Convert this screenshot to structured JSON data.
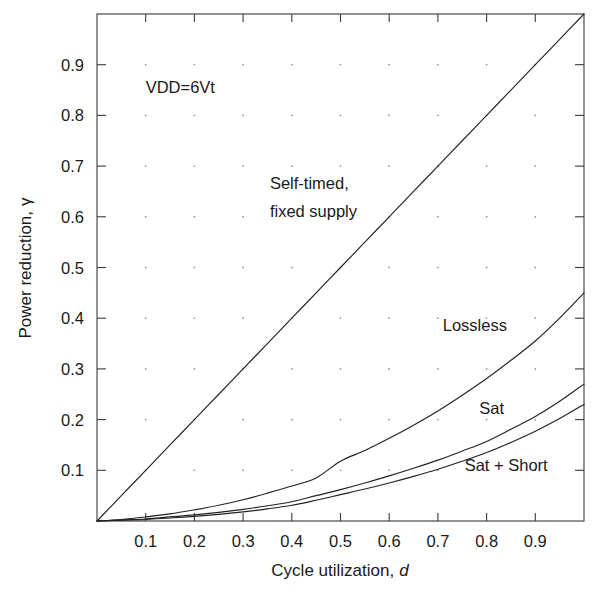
{
  "chart_data": {
    "type": "line",
    "title": "",
    "xlabel": "Cycle utilization, d",
    "xlabel_main": "Cycle utilization,",
    "xlabel_italic": "d",
    "ylabel": "Power reduction, γ",
    "ylabel_main": "Power reduction,",
    "ylabel_symbol": "γ",
    "xlim": [
      0,
      1
    ],
    "ylim": [
      0,
      1
    ],
    "grid": "dots at 0.1 intervals",
    "legend_position": "inline annotations on curves",
    "xticks": [
      0.1,
      0.2,
      0.3,
      0.4,
      0.5,
      0.6,
      0.7,
      0.8,
      0.9
    ],
    "xticklabels": [
      "0.1",
      "0.2",
      "0.3",
      "0.4",
      "0.5",
      "0.6",
      "0.7",
      "0.8",
      "0.9"
    ],
    "yticks": [
      0.1,
      0.2,
      0.3,
      0.4,
      0.5,
      0.6,
      0.7,
      0.8,
      0.9
    ],
    "yticklabels": [
      "0.1",
      "0.2",
      "0.3",
      "0.4",
      "0.5",
      "0.6",
      "0.7",
      "0.8",
      "0.9"
    ],
    "annotations": [
      {
        "name": "vdd-note",
        "text": "VDD=6Vt",
        "x": 0.1,
        "y": 0.845
      },
      {
        "name": "self-timed-label-line1",
        "text": "Self-timed,",
        "x": 0.355,
        "y": 0.655
      },
      {
        "name": "self-timed-label-line2",
        "text": "fixed supply",
        "x": 0.355,
        "y": 0.6
      },
      {
        "name": "lossless-label",
        "text": "Lossless",
        "x": 0.71,
        "y": 0.375
      },
      {
        "name": "sat-label",
        "text": "Sat",
        "x": 0.785,
        "y": 0.212
      },
      {
        "name": "sat-short-label",
        "text": "Sat + Short",
        "x": 0.755,
        "y": 0.098
      }
    ],
    "x": [
      0,
      0.05,
      0.1,
      0.15,
      0.2,
      0.25,
      0.3,
      0.35,
      0.4,
      0.45,
      0.5,
      0.55,
      0.6,
      0.65,
      0.7,
      0.75,
      0.8,
      0.85,
      0.9,
      0.95,
      1.0
    ],
    "series": [
      {
        "name": "Self-timed, fixed supply",
        "color": "#222222",
        "values": [
          0,
          0.05,
          0.1,
          0.15,
          0.2,
          0.25,
          0.3,
          0.35,
          0.4,
          0.45,
          0.5,
          0.55,
          0.6,
          0.65,
          0.7,
          0.75,
          0.8,
          0.85,
          0.9,
          0.95,
          1.0
        ]
      },
      {
        "name": "Lossless",
        "color": "#222222",
        "values": [
          0,
          0.003,
          0.008,
          0.014,
          0.022,
          0.031,
          0.042,
          0.055,
          0.069,
          0.085,
          0.118,
          0.139,
          0.163,
          0.189,
          0.217,
          0.248,
          0.281,
          0.317,
          0.355,
          0.4,
          0.45
        ]
      },
      {
        "name": "Sat",
        "color": "#222222",
        "values": [
          0,
          0.002,
          0.004,
          0.008,
          0.012,
          0.017,
          0.023,
          0.03,
          0.038,
          0.05,
          0.062,
          0.075,
          0.089,
          0.104,
          0.12,
          0.138,
          0.157,
          0.181,
          0.206,
          0.236,
          0.27
        ]
      },
      {
        "name": "Sat + Short",
        "color": "#222222",
        "values": [
          0,
          0.0015,
          0.003,
          0.006,
          0.009,
          0.013,
          0.018,
          0.024,
          0.031,
          0.041,
          0.052,
          0.063,
          0.075,
          0.088,
          0.102,
          0.118,
          0.135,
          0.155,
          0.177,
          0.202,
          0.23
        ]
      }
    ]
  }
}
